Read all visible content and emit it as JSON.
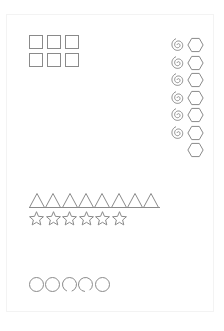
{
  "worksheet": {
    "stroke_color": "#8a8a8a",
    "background": "#ffffff",
    "squares": {
      "rows": 2,
      "cols": 3,
      "count": 6
    },
    "spirals": {
      "count": 6
    },
    "hexagons": {
      "count": 7
    },
    "triangles": {
      "count": 8
    },
    "stars": {
      "count": 6
    },
    "circles": {
      "count": 5
    }
  }
}
